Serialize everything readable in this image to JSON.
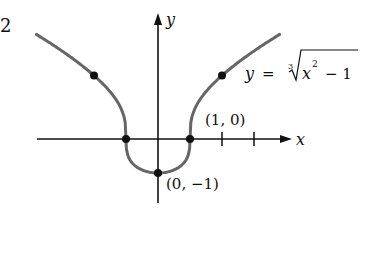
{
  "problem_number": "2",
  "chart_data": {
    "type": "line",
    "title": "",
    "function_label": "y = ∛(x² − 1)",
    "function_parts": {
      "lhs": "y",
      "eq": "=",
      "index": "3",
      "radicand_base": "x",
      "radicand_exp": "2",
      "radicand_rest": "− 1"
    },
    "xlabel": "x",
    "ylabel": "y",
    "xlim": [
      -3.8,
      4
    ],
    "ylim": [
      -1.5,
      2.8
    ],
    "grid": false,
    "x_ticks": [
      1,
      2,
      3
    ],
    "labeled_points": [
      {
        "x": 1,
        "y": 0,
        "label": "(1, 0)"
      },
      {
        "x": 0,
        "y": -1,
        "label": "(0, −1)"
      }
    ],
    "marked_points": [
      {
        "x": -2,
        "y": 1.442
      },
      {
        "x": -1,
        "y": 0
      },
      {
        "x": 0,
        "y": -1
      },
      {
        "x": 1,
        "y": 0
      },
      {
        "x": 2,
        "y": 1.442
      }
    ],
    "curve_color": "#666666",
    "axis_color": "#111111"
  }
}
